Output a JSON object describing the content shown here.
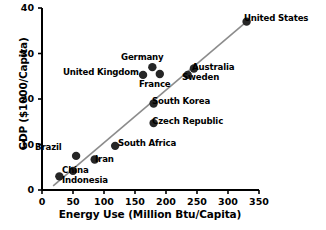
{
  "chart_data": {
    "type": "scatter",
    "title": "",
    "xlabel": "Energy Use (Million Btu/Capita)",
    "ylabel": "GDP ($1000/Capita)",
    "xlim": [
      0,
      350
    ],
    "ylim": [
      0,
      40
    ],
    "xticks": [
      "0",
      "50",
      "100",
      "150",
      "200",
      "250",
      "300",
      "350"
    ],
    "yticks": [
      "0",
      "10",
      "20",
      "30",
      "40"
    ],
    "grid": false,
    "legend": "none",
    "x": [
      28,
      50,
      55,
      85,
      118,
      180,
      180,
      163,
      178,
      190,
      235,
      245,
      330
    ],
    "y": [
      3.0,
      4.2,
      7.5,
      6.7,
      9.7,
      14.7,
      19.0,
      25.3,
      27.0,
      25.5,
      25.3,
      26.7,
      37.0
    ],
    "labels": [
      "Indonesia",
      "China",
      "Brazil",
      "Iran",
      "South Africa",
      "Czech Republic",
      "South Korea",
      "United Kingdom",
      "Germany",
      "France",
      "Sweden",
      "Australia",
      "United States"
    ],
    "points": [
      {
        "name": "Indonesia",
        "x": 28,
        "y": 3.0,
        "label": "Indonesia",
        "label_left": 62,
        "label_top": 176
      },
      {
        "name": "China",
        "x": 50,
        "y": 4.2,
        "label": "China",
        "label_left": 62,
        "label_top": 166
      },
      {
        "name": "Brazil",
        "x": 55,
        "y": 7.5,
        "label": "Brazil",
        "label_left": 35,
        "label_top": 143
      },
      {
        "name": "Iran",
        "x": 85,
        "y": 6.7,
        "label": "Iran",
        "label_left": 95,
        "label_top": 155
      },
      {
        "name": "South Africa",
        "x": 118,
        "y": 9.7,
        "label": "South Africa",
        "label_left": 118,
        "label_top": 139
      },
      {
        "name": "Czech Republic",
        "x": 180,
        "y": 14.7,
        "label": "Czech Republic",
        "label_left": 152,
        "label_top": 117
      },
      {
        "name": "South Korea",
        "x": 180,
        "y": 19.0,
        "label": "South Korea",
        "label_left": 152,
        "label_top": 97
      },
      {
        "name": "United Kingdom",
        "x": 163,
        "y": 25.3,
        "label": "United Kingdom",
        "label_left": 63,
        "label_top": 68
      },
      {
        "name": "Germany",
        "x": 178,
        "y": 27.0,
        "label": "Germany",
        "label_left": 121,
        "label_top": 53
      },
      {
        "name": "France",
        "x": 190,
        "y": 25.5,
        "label": "France",
        "label_left": 139,
        "label_top": 80
      },
      {
        "name": "Sweden",
        "x": 235,
        "y": 25.3,
        "label": "Sweden",
        "label_left": 182,
        "label_top": 73
      },
      {
        "name": "Australia",
        "x": 245,
        "y": 26.7,
        "label": "Australia",
        "label_left": 192,
        "label_top": 63
      },
      {
        "name": "United States",
        "x": 330,
        "y": 37.0,
        "label": "United States",
        "label_left": 244,
        "label_top": 14
      }
    ],
    "trendline": {
      "x0": 18,
      "y0": 0.9,
      "x1": 330,
      "y1": 37.0,
      "color": "#8c8c8c"
    },
    "marker_color": "#262626",
    "axis_color": "#000000"
  }
}
